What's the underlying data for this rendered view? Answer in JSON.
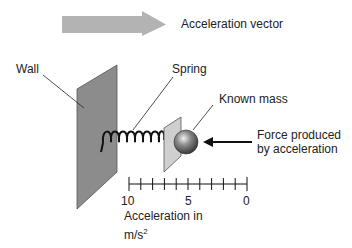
{
  "legend": {
    "arrow_label": "Acceleration vector",
    "arrow_color": "#b3b3b3"
  },
  "labels": {
    "wall": "Wall",
    "spring": "Spring",
    "known_mass": "Known mass",
    "force_line1": "Force produced",
    "force_line2": "by acceleration"
  },
  "scale": {
    "ticks": [
      "10",
      "5",
      "0"
    ],
    "tick_count": 11,
    "axis_label_line1": "Acceleration in",
    "axis_label_unit": "m/s",
    "axis_label_exponent": "2"
  },
  "colors": {
    "wall": "#8c8c8c",
    "plate": "#cfcfcf",
    "mass": "#6e6e6e",
    "line": "#222222"
  }
}
